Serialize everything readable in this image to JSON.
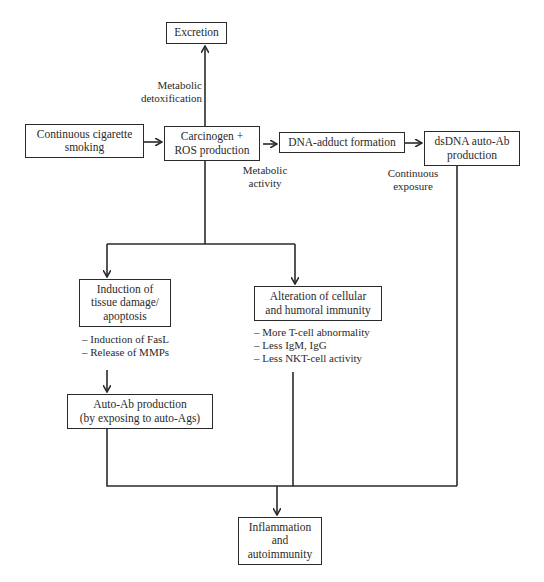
{
  "diagram": {
    "nodes": {
      "excretion": {
        "lines": [
          "Excretion"
        ]
      },
      "smoking": {
        "lines": [
          "Continuous cigarette",
          "smoking"
        ]
      },
      "carcinogen": {
        "lines": [
          "Carcinogen +",
          "ROS production"
        ]
      },
      "dna_adduct": {
        "lines": [
          "DNA-adduct formation"
        ]
      },
      "dsdna": {
        "lines": [
          "dsDNA auto-Ab",
          "production"
        ]
      },
      "tissue_damage": {
        "lines": [
          "Induction of",
          "tissue damage/",
          "apoptosis"
        ]
      },
      "immunity": {
        "lines": [
          "Alteration of cellular",
          "and humoral immunity"
        ]
      },
      "auto_ab": {
        "lines": [
          "Auto-Ab production",
          "(by exposing to auto-Ags)"
        ]
      },
      "inflammation": {
        "lines": [
          "Inflammation",
          "and",
          "autoimmunity"
        ]
      }
    },
    "edge_labels": {
      "detox": [
        "Metabolic",
        "detoxification"
      ],
      "activity": [
        "Metabolic",
        "activity"
      ],
      "exposure": [
        "Continuous",
        "exposure"
      ]
    },
    "lists": {
      "tissue_damage": [
        "– Induction of FasL",
        "– Release of MMPs"
      ],
      "immunity": [
        "– More T-cell abnormality",
        "– Less IgM, IgG",
        "– Less NKT-cell activity"
      ]
    }
  }
}
